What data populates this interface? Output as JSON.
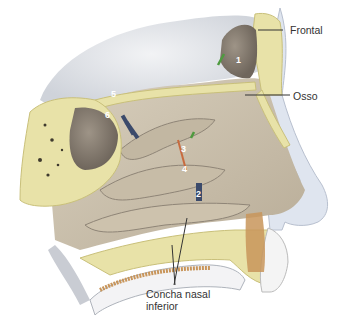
{
  "figure": {
    "colors": {
      "bone": "#e8e2a8",
      "bone_outline": "#c9c07a",
      "mucosa": "#cfc4b0",
      "mucosa_shadow": "#8f8577",
      "brain": "#e6e8ec",
      "skin": "#dde3ee",
      "teeth_brown": "#c8955a",
      "leader_line": "#333333"
    },
    "labels": {
      "frontal": "Frontal",
      "osso": "Osso",
      "concha_line1": "Concha nasal",
      "concha_line2": "inferior"
    },
    "markers": [
      {
        "id": "1",
        "text": "1"
      },
      {
        "id": "2",
        "text": "2"
      },
      {
        "id": "3",
        "text": "3"
      },
      {
        "id": "4",
        "text": "4"
      },
      {
        "id": "5",
        "text": "5"
      },
      {
        "id": "6",
        "text": "6"
      }
    ]
  }
}
